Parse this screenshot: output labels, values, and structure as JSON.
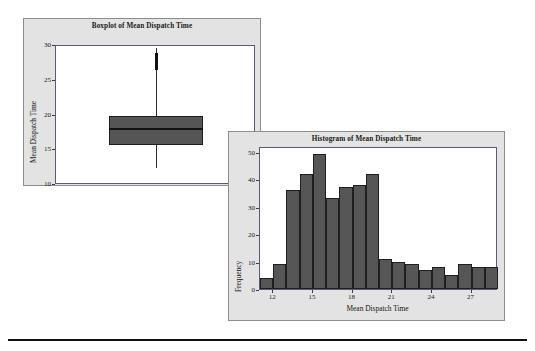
{
  "figure": {
    "caption_rule": true
  },
  "chart_data": [
    {
      "type": "boxplot",
      "title": "Boxplot of Mean Dispatch Time",
      "xlabel": "",
      "ylabel": "Mean Dispatch Time",
      "ylim": [
        10,
        30
      ],
      "yticks": [
        10,
        15,
        20,
        25,
        30
      ],
      "ytick_labels": [
        "10",
        "15",
        "20",
        "25",
        "30"
      ],
      "grid": false,
      "box": {
        "q1": 15.8,
        "median": 18.0,
        "q3": 20.0,
        "whisker_low": 12.4,
        "whisker_high": 29.7,
        "outliers": [
          26.8,
          27.2,
          27.6,
          28.0,
          28.4,
          28.8
        ]
      }
    },
    {
      "type": "histogram",
      "title": "Histogram of Mean Dispatch Time",
      "xlabel": "Mean Dispatch Time",
      "ylabel": "Frequency",
      "ylim": [
        0,
        52
      ],
      "yticks": [
        0,
        10,
        20,
        30,
        40,
        50
      ],
      "ytick_labels": [
        "0",
        "10",
        "20",
        "30",
        "40",
        "50"
      ],
      "xlim": [
        11.0,
        29.0
      ],
      "xticks": [
        12,
        15,
        18,
        21,
        24,
        27
      ],
      "xtick_labels": [
        "12",
        "15",
        "18",
        "21",
        "24",
        "27"
      ],
      "grid": false,
      "bin_width": 1,
      "bin_starts": [
        11,
        12,
        13,
        14,
        15,
        16,
        17,
        18,
        19,
        20,
        21,
        22,
        23,
        24,
        25,
        26,
        27,
        28
      ],
      "values": [
        4,
        9,
        36,
        42,
        49,
        33,
        37,
        38,
        42,
        11,
        10,
        9,
        7,
        8,
        5,
        9,
        8,
        8
      ]
    }
  ],
  "colors": {
    "panel_background": "#e3e3e3",
    "plot_background": "#ffffff",
    "bar_fill": "#565656",
    "bar_edge": "#1f1f1f",
    "box_fill": "#555555",
    "axis": "#3a3a3a",
    "text": "#1a1a1a"
  }
}
